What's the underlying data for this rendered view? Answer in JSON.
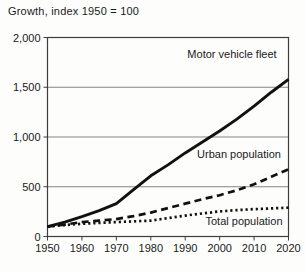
{
  "chart_data": {
    "type": "line",
    "title": "Growth, index 1950 = 100",
    "xlabel": "",
    "ylabel": "Growth, index 1950 = 100",
    "xlim": [
      1950,
      2020
    ],
    "ylim": [
      0,
      2000
    ],
    "grid": "horizontal",
    "legend": "inline-labels",
    "x_ticks": [
      1950,
      1960,
      1970,
      1980,
      1990,
      2000,
      2010,
      2020
    ],
    "y_ticks": [
      0,
      500,
      1000,
      1500,
      2000
    ],
    "y_tick_labels": [
      "0",
      "500",
      "1,000",
      "1,500",
      "2,000"
    ],
    "x": [
      1950,
      1955,
      1960,
      1965,
      1970,
      1975,
      1980,
      1985,
      1990,
      1995,
      2000,
      2005,
      2010,
      2015,
      2020
    ],
    "series": [
      {
        "name": "Motor vehicle fleet",
        "style": "solid",
        "values": [
          100,
          145,
          200,
          260,
          330,
          470,
          610,
          720,
          840,
          950,
          1060,
          1180,
          1310,
          1450,
          1580
        ]
      },
      {
        "name": "Urban population",
        "style": "dashed",
        "values": [
          100,
          120,
          145,
          160,
          175,
          205,
          240,
          285,
          330,
          375,
          415,
          465,
          525,
          600,
          675
        ]
      },
      {
        "name": "Total population",
        "style": "dotted",
        "values": [
          100,
          115,
          128,
          137,
          145,
          152,
          160,
          185,
          210,
          232,
          252,
          265,
          275,
          282,
          290
        ]
      }
    ],
    "colors": {
      "line": "#111111",
      "grid": "#858585",
      "frame": "#3d3d3d",
      "text": "#1a1a1a",
      "background": "#fdfdfc"
    }
  }
}
